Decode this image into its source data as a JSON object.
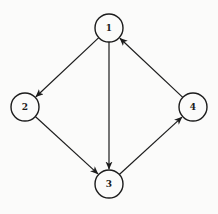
{
  "diagram": {
    "type": "directed-graph",
    "title": "",
    "colors": {
      "background": "#fbfbfa",
      "stroke": "#1c1c1c",
      "node_fill": "#fbfbfa",
      "label": "#1c1c1c"
    },
    "node_radius": 14,
    "node_stroke_width": 1.4,
    "edge_stroke_width": 1.2,
    "nodes": [
      {
        "id": "1",
        "label": "1",
        "x": 109,
        "y": 28
      },
      {
        "id": "2",
        "label": "2",
        "x": 25,
        "y": 107
      },
      {
        "id": "3",
        "label": "3",
        "x": 109,
        "y": 184
      },
      {
        "id": "4",
        "label": "4",
        "x": 193,
        "y": 107
      }
    ],
    "edges": [
      {
        "from": "1",
        "to": "2",
        "directed": true
      },
      {
        "from": "1",
        "to": "3",
        "directed": true
      },
      {
        "from": "2",
        "to": "3",
        "directed": true
      },
      {
        "from": "3",
        "to": "4",
        "directed": true
      },
      {
        "from": "4",
        "to": "1",
        "directed": true
      }
    ]
  }
}
